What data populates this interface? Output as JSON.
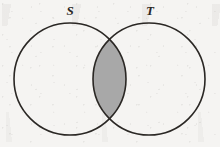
{
  "figure": {
    "kind": "venn-diagram",
    "width": 220,
    "height": 147,
    "background_color": "#f5f4f2",
    "stroke_color": "#2a2724",
    "stroke_width": 1.6,
    "shaded_region_color": "#a8a8a8",
    "shaded_region_meaning": "intersection"
  },
  "labels": {
    "left_set": "S",
    "right_set": "T"
  },
  "chart_data": {
    "type": "venn",
    "title": "",
    "sets": [
      {
        "name": "S",
        "label": "S",
        "center_x": 70,
        "center_y": 79,
        "radius": 56,
        "label_x": 70,
        "label_y": 10,
        "fill": "none"
      },
      {
        "name": "T",
        "label": "T",
        "center_x": 149,
        "center_y": 79,
        "radius": 56,
        "label_x": 150,
        "label_y": 10,
        "fill": "none"
      }
    ],
    "regions": [
      {
        "id": "S-only",
        "label": "S \\ T",
        "shaded": false,
        "fill": "none"
      },
      {
        "id": "T-only",
        "label": "T \\ S",
        "shaded": false,
        "fill": "none"
      },
      {
        "id": "S-and-T",
        "label": "S ∩ T",
        "shaded": true,
        "fill": "#a8a8a8"
      }
    ],
    "intersection_points": [
      {
        "x": 110,
        "y": 37
      },
      {
        "x": 110,
        "y": 120
      }
    ],
    "legend": [],
    "annotations": []
  }
}
